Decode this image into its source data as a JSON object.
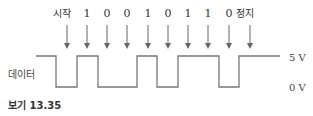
{
  "diagram": {
    "bit_labels": [
      "시작",
      "1",
      "0",
      "0",
      "1",
      "0",
      "1",
      "1",
      "0",
      "정지"
    ],
    "bit_x": [
      67,
      87,
      107,
      127,
      148,
      168,
      188,
      208,
      229,
      250
    ],
    "signal_label": "데이터",
    "high_label": "5 V",
    "low_label": "0 V",
    "caption": "보기 13.35",
    "waveform_points": "36,56 56,56 56,87 77,87 77,56 98,56 98,87 137,87 137,56 157,56 157,87 178,87 178,56 219,56 219,87 239,87 239,56 280,56",
    "colors": {
      "line": "#777777",
      "arrow": "#666666",
      "text": "#333333"
    }
  }
}
